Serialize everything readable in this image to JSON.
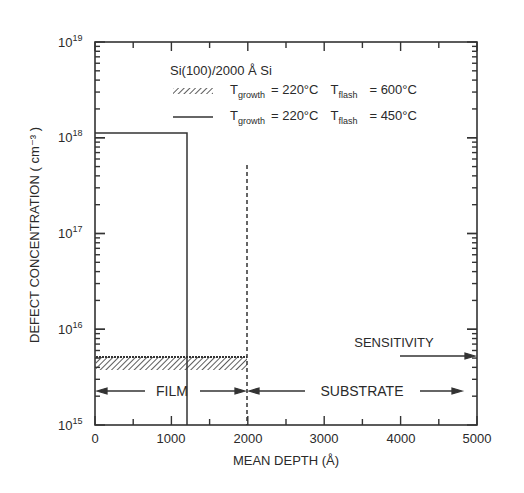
{
  "chart_data": {
    "type": "line",
    "title": "",
    "xlabel": "MEAN DEPTH (Å)",
    "ylabel": "DEFECT CONCENTRATION ( cm⁻³ )",
    "xlim": [
      0,
      5000
    ],
    "ylim": [
      1000000000000000.0,
      1e+19
    ],
    "yscale": "log",
    "x_ticks": [
      "0",
      "1000",
      "2000",
      "3000",
      "4000",
      "5000"
    ],
    "y_ticks": [
      {
        "base": "10",
        "exp": "15"
      },
      {
        "base": "10",
        "exp": "16"
      },
      {
        "base": "10",
        "exp": "17"
      },
      {
        "base": "10",
        "exp": "18"
      },
      {
        "base": "10",
        "exp": "19"
      }
    ],
    "legend": {
      "title": "Si(100)/2000 Å Si",
      "position": "upper right",
      "entries": [
        {
          "style": "hatched",
          "tgrowth_label": "T",
          "tgrowth_sub": "growth",
          "tgrowth_val": "= 220°C",
          "tflash_label": "T",
          "tflash_sub": "flash",
          "tflash_val": "= 600°C"
        },
        {
          "style": "solid",
          "tgrowth_label": "T",
          "tgrowth_sub": "growth",
          "tgrowth_val": "= 220°C",
          "tflash_label": "T",
          "tflash_sub": "flash",
          "tflash_val": "= 450°C"
        }
      ]
    },
    "series": [
      {
        "name": "Tgrowth = 220°C, Tflash = 600°C",
        "style": "hatched band",
        "x": [
          0,
          2000
        ],
        "y_range": [
          4000000000000000.0,
          5000000000000000.0
        ]
      },
      {
        "name": "Tgrowth = 220°C, Tflash = 450°C",
        "style": "solid step",
        "x": [
          0,
          1200
        ],
        "y": 1.1e+18
      }
    ],
    "annotations": [
      {
        "text": "FILM",
        "type": "double arrow",
        "x_range": [
          0,
          2000
        ],
        "y": 2300000000000000.0
      },
      {
        "text": "SUBSTRATE",
        "type": "double arrow",
        "x_range": [
          2000,
          5000
        ],
        "y": 2300000000000000.0
      },
      {
        "text": "SENSITIVITY",
        "type": "arrow",
        "x_from": 4000,
        "x_to": 5000,
        "y": 5000000000000000.0
      },
      {
        "text": "",
        "type": "dashed vertical",
        "x": 2000,
        "y_top": 5e+17
      }
    ],
    "grid": false
  }
}
